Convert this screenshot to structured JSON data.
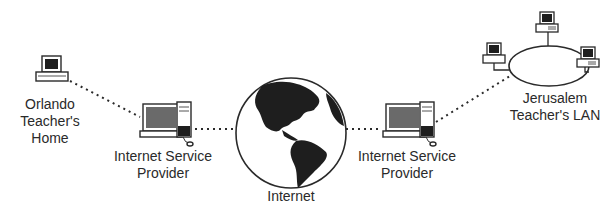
{
  "nodes": {
    "orlando": {
      "line1": "Orlando",
      "line2": "Teacher's",
      "line3": "Home"
    },
    "isp_left": {
      "line1": "Internet Service",
      "line2": "Provider"
    },
    "internet": {
      "label": "Internet"
    },
    "isp_right": {
      "line1": "Internet Service",
      "line2": "Provider"
    },
    "jerusalem": {
      "line1": "Jerusalem",
      "line2": "Teacher's LAN"
    }
  },
  "colors": {
    "ink": "#2a2a2a",
    "screen": "#1e1e1e",
    "screen_gray": "#6a6a6a",
    "background": "#ffffff"
  }
}
